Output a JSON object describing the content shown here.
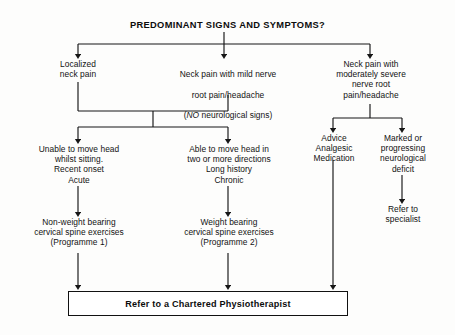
{
  "title": "PREDOMINANT SIGNS AND SYMPTOMS?",
  "nodes": {
    "localized_neck_pain": "Localized\nneck pain",
    "mild_nerve_root_line1": "Neck pain with mild nerve",
    "mild_nerve_root_line2": "root pain/headache",
    "mild_nerve_root_line3_prefix": "(",
    "mild_nerve_root_line3_emphasis": "NO",
    "mild_nerve_root_line3_suffix": " neurological signs)",
    "moderately_severe": "Neck pain with\nmoderately severe\nnerve root\npain/headache",
    "unable_to_move": "Unable to move head\nwhilst sitting.\nRecent onset\nAcute",
    "able_to_move": "Able to move head in\ntwo or more directions\nLong history\nChronic",
    "advice_analgesic": "Advice\nAnalgesic\nMedication",
    "marked_progressing": "Marked or\nprogressing\nneurological\ndeficit",
    "non_weight_bearing": "Non-weight bearing\ncervical spine exercises\n(Programme 1)",
    "weight_bearing": "Weight bearing\ncervical spine exercises\n(Programme 2)",
    "refer_specialist": "Refer to\nspecialist",
    "terminal": "Refer to a Chartered Physiotherapist"
  },
  "style": {
    "line_color": "#161616",
    "background": "#fdfdfc",
    "text_color": "#121212"
  }
}
